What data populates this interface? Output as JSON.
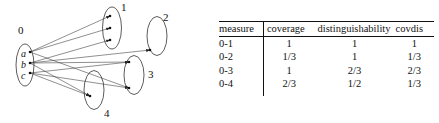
{
  "diagram": {
    "set_labels": [
      {
        "name": "0",
        "x": 18,
        "y": 25
      },
      {
        "name": "1",
        "x": 121,
        "y": 2
      },
      {
        "name": "2",
        "x": 163,
        "y": 12
      },
      {
        "name": "3",
        "x": 148,
        "y": 69
      },
      {
        "name": "4",
        "x": 104,
        "y": 108
      }
    ],
    "element_labels": [
      {
        "name": "a",
        "x": 21,
        "y": 49
      },
      {
        "name": "b",
        "x": 21,
        "y": 60
      },
      {
        "name": "c",
        "x": 21,
        "y": 71
      }
    ],
    "ellipses": [
      {
        "id": "set-0",
        "cx": 25,
        "cy": 65,
        "rx": 9,
        "ry": 21
      },
      {
        "id": "set-1",
        "cx": 112,
        "cy": 28,
        "rx": 9.5,
        "ry": 21
      },
      {
        "id": "set-2",
        "cx": 157,
        "cy": 36,
        "rx": 10,
        "ry": 19.5
      },
      {
        "id": "set-3",
        "cx": 134,
        "cy": 75,
        "rx": 10,
        "ry": 19.5
      },
      {
        "id": "set-4",
        "cx": 94,
        "cy": 90,
        "rx": 10,
        "ry": 19.5
      }
    ],
    "points": [
      {
        "id": "p0-a",
        "x": 30,
        "y": 52
      },
      {
        "id": "p0-b",
        "x": 30,
        "y": 63
      },
      {
        "id": "p0-c",
        "x": 30,
        "y": 73
      },
      {
        "id": "p1-1",
        "x": 110,
        "y": 16
      },
      {
        "id": "p1-2",
        "x": 110,
        "y": 28
      },
      {
        "id": "p1-3",
        "x": 110,
        "y": 40
      },
      {
        "id": "p2-1",
        "x": 150,
        "y": 50
      },
      {
        "id": "p3-1",
        "x": 129,
        "y": 62
      },
      {
        "id": "p3-2",
        "x": 129,
        "y": 88
      },
      {
        "id": "p4-1",
        "x": 90,
        "y": 96
      }
    ],
    "edges": [
      {
        "from": "p0-a",
        "to": "p1-1"
      },
      {
        "from": "p0-a",
        "to": "p1-2"
      },
      {
        "from": "p0-b",
        "to": "p1-3"
      },
      {
        "from": "p0-b",
        "to": "p2-1"
      },
      {
        "from": "p0-b",
        "to": "p3-1"
      },
      {
        "from": "p0-c",
        "to": "p3-1"
      },
      {
        "from": "p0-c",
        "to": "p3-2"
      },
      {
        "from": "p0-c",
        "to": "p4-1"
      },
      {
        "from": "p0-b",
        "to": "p4-1"
      },
      {
        "from": "p0-a",
        "to": "p3-2"
      }
    ]
  },
  "table": {
    "headers": {
      "measure": "measure",
      "coverage": "coverage",
      "distinguishability": "distinguishability",
      "covdis": "covdis"
    },
    "rows": [
      {
        "measure": "0-1",
        "coverage": "1",
        "distinguishability": "1",
        "covdis": "1"
      },
      {
        "measure": "0-2",
        "coverage": "1/3",
        "distinguishability": "1",
        "covdis": "1/3"
      },
      {
        "measure": "0-3",
        "coverage": "1",
        "distinguishability": "2/3",
        "covdis": "2/3"
      },
      {
        "measure": "0-4",
        "coverage": "2/3",
        "distinguishability": "1/2",
        "covdis": "1/3"
      }
    ]
  },
  "colors": {
    "ink": "#111111",
    "background": "#ffffff"
  }
}
